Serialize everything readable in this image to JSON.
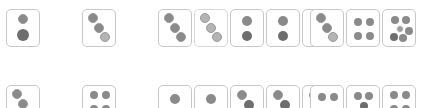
{
  "canvas": {
    "width": 422,
    "height": 108,
    "background": "#ffffff",
    "description": "Two horizontal rows of small white rounded dice-face cards with gray pips; bottom row is clipped by the image edge"
  },
  "style": {
    "card_fill": "#ffffff",
    "card_border": "#c8c8c8",
    "card_border_light": "#d8d8d8",
    "pip_dark": "#6e6e6e",
    "pip_mid": "#8a8a8a",
    "pip_light": "#b4b4b4",
    "card_width": 34,
    "card_height": 38,
    "card_radius": 5
  },
  "rows": [
    {
      "name": "top-row",
      "top": 9,
      "clipped": false,
      "groups": [
        {
          "name": "group-1",
          "left": 6,
          "cards": [
            {
              "name": "card-two-vertical",
              "pip_count": 2,
              "layout": "vertical-center",
              "border": "normal",
              "pips": [
                {
                  "x": 16,
                  "y": 9,
                  "r": 5,
                  "tone": "mid",
                  "style": "ring"
                },
                {
                  "x": 16,
                  "y": 25,
                  "r": 6,
                  "tone": "dark",
                  "style": "plain"
                }
              ]
            }
          ]
        },
        {
          "name": "group-2",
          "left": 82,
          "cards": [
            {
              "name": "card-three-diagonal",
              "pip_count": 3,
              "layout": "diagonal-down-right",
              "border": "normal",
              "pips": [
                {
                  "x": 10,
                  "y": 8,
                  "r": 5,
                  "tone": "mid",
                  "style": "ring"
                },
                {
                  "x": 16,
                  "y": 18,
                  "r": 5,
                  "tone": "mid",
                  "style": "ring"
                },
                {
                  "x": 22,
                  "y": 27,
                  "r": 5,
                  "tone": "light",
                  "style": "ring"
                }
              ]
            }
          ]
        },
        {
          "name": "group-3",
          "left": 158,
          "cards": [
            {
              "name": "card-three-diagonal",
              "pip_count": 3,
              "layout": "diagonal-down-right",
              "border": "normal",
              "pips": [
                {
                  "x": 10,
                  "y": 8,
                  "r": 5,
                  "tone": "mid",
                  "style": "ring"
                },
                {
                  "x": 16,
                  "y": 18,
                  "r": 5,
                  "tone": "mid",
                  "style": "ring"
                },
                {
                  "x": 22,
                  "y": 27,
                  "r": 5,
                  "tone": "mid",
                  "style": "ring"
                }
              ]
            },
            {
              "name": "card-three-diagonal-light",
              "pip_count": 3,
              "layout": "diagonal-down-right",
              "border": "light",
              "pips": [
                {
                  "x": 10,
                  "y": 8,
                  "r": 5,
                  "tone": "light",
                  "style": "ring"
                },
                {
                  "x": 16,
                  "y": 18,
                  "r": 5,
                  "tone": "light",
                  "style": "ring"
                },
                {
                  "x": 22,
                  "y": 27,
                  "r": 5,
                  "tone": "light",
                  "style": "ring"
                }
              ]
            },
            {
              "name": "card-two-vertical",
              "pip_count": 2,
              "layout": "vertical-center",
              "border": "normal",
              "pips": [
                {
                  "x": 16,
                  "y": 11,
                  "r": 5,
                  "tone": "mid",
                  "style": "plain"
                },
                {
                  "x": 16,
                  "y": 26,
                  "r": 5,
                  "tone": "dark",
                  "style": "plain"
                }
              ]
            },
            {
              "name": "card-two-vertical",
              "pip_count": 2,
              "layout": "vertical-center",
              "border": "normal",
              "pips": [
                {
                  "x": 16,
                  "y": 11,
                  "r": 5,
                  "tone": "mid",
                  "style": "plain"
                },
                {
                  "x": 16,
                  "y": 26,
                  "r": 5,
                  "tone": "dark",
                  "style": "plain"
                }
              ]
            },
            {
              "name": "card-two-vertical",
              "pip_count": 2,
              "layout": "vertical-center",
              "border": "normal",
              "pips": [
                {
                  "x": 16,
                  "y": 11,
                  "r": 5,
                  "tone": "mid",
                  "style": "plain"
                },
                {
                  "x": 16,
                  "y": 26,
                  "r": 5,
                  "tone": "dark",
                  "style": "plain"
                }
              ]
            }
          ]
        },
        {
          "name": "group-4",
          "left": 310,
          "cards": [
            {
              "name": "card-three-diagonal",
              "pip_count": 3,
              "layout": "diagonal-down-right",
              "border": "normal",
              "pips": [
                {
                  "x": 10,
                  "y": 8,
                  "r": 5,
                  "tone": "mid",
                  "style": "ring"
                },
                {
                  "x": 16,
                  "y": 18,
                  "r": 5,
                  "tone": "mid",
                  "style": "ring"
                },
                {
                  "x": 22,
                  "y": 27,
                  "r": 5,
                  "tone": "light",
                  "style": "ring"
                }
              ]
            },
            {
              "name": "card-four-square",
              "pip_count": 4,
              "layout": "square-2x2",
              "border": "normal",
              "pips": [
                {
                  "x": 11,
                  "y": 12,
                  "r": 4,
                  "tone": "mid",
                  "style": "plain"
                },
                {
                  "x": 23,
                  "y": 12,
                  "r": 4,
                  "tone": "mid",
                  "style": "plain"
                },
                {
                  "x": 11,
                  "y": 26,
                  "r": 4,
                  "tone": "mid",
                  "style": "plain"
                },
                {
                  "x": 23,
                  "y": 26,
                  "r": 4,
                  "tone": "mid",
                  "style": "plain"
                }
              ]
            },
            {
              "name": "card-six-grid",
              "pip_count": 6,
              "layout": "grid-2x3",
              "border": "normal",
              "pips": [
                {
                  "x": 12,
                  "y": 10,
                  "r": 4,
                  "tone": "mid",
                  "style": "plain"
                },
                {
                  "x": 23,
                  "y": 10,
                  "r": 4,
                  "tone": "mid",
                  "style": "plain"
                },
                {
                  "x": 17,
                  "y": 19,
                  "r": 4,
                  "tone": "dark",
                  "style": "halo"
                },
                {
                  "x": 11,
                  "y": 27,
                  "r": 4,
                  "tone": "dark",
                  "style": "plain"
                },
                {
                  "x": 20,
                  "y": 28,
                  "r": 4,
                  "tone": "mid",
                  "style": "plain"
                },
                {
                  "x": 26,
                  "y": 21,
                  "r": 4,
                  "tone": "mid",
                  "style": "plain"
                }
              ]
            }
          ]
        }
      ]
    },
    {
      "name": "bottom-row",
      "top": 85,
      "clipped": true,
      "groups": [
        {
          "name": "group-1",
          "left": 6,
          "cards": [
            {
              "name": "card-three-diagonal",
              "pip_count": 3,
              "layout": "diagonal-down-right",
              "border": "normal",
              "pips": [
                {
                  "x": 10,
                  "y": 8,
                  "r": 5,
                  "tone": "mid",
                  "style": "ring"
                },
                {
                  "x": 16,
                  "y": 18,
                  "r": 5,
                  "tone": "mid",
                  "style": "ring"
                },
                {
                  "x": 22,
                  "y": 27,
                  "r": 5,
                  "tone": "light",
                  "style": "ring"
                }
              ]
            }
          ]
        },
        {
          "name": "group-2",
          "left": 82,
          "cards": [
            {
              "name": "card-four-square",
              "pip_count": 4,
              "layout": "square-2x2",
              "border": "normal",
              "pips": [
                {
                  "x": 11,
                  "y": 9,
                  "r": 4,
                  "tone": "mid",
                  "style": "plain"
                },
                {
                  "x": 23,
                  "y": 9,
                  "r": 4,
                  "tone": "mid",
                  "style": "plain"
                },
                {
                  "x": 11,
                  "y": 23,
                  "r": 4,
                  "tone": "mid",
                  "style": "plain"
                },
                {
                  "x": 23,
                  "y": 23,
                  "r": 4,
                  "tone": "mid",
                  "style": "plain"
                }
              ]
            }
          ]
        },
        {
          "name": "group-3",
          "left": 158,
          "cards": [
            {
              "name": "card-one-center",
              "pip_count": 1,
              "layout": "single-center",
              "border": "normal",
              "pips": [
                {
                  "x": 16,
                  "y": 13,
                  "r": 5,
                  "tone": "mid",
                  "style": "plain"
                }
              ]
            },
            {
              "name": "card-one-center",
              "pip_count": 1,
              "layout": "single-center",
              "border": "normal",
              "pips": [
                {
                  "x": 16,
                  "y": 13,
                  "r": 5,
                  "tone": "mid",
                  "style": "plain"
                }
              ]
            },
            {
              "name": "card-two-diagonal",
              "pip_count": 2,
              "layout": "diagonal-down-right",
              "border": "normal",
              "pips": [
                {
                  "x": 11,
                  "y": 9,
                  "r": 5,
                  "tone": "mid",
                  "style": "ring"
                },
                {
                  "x": 18,
                  "y": 19,
                  "r": 5,
                  "tone": "dark",
                  "style": "plain"
                }
              ]
            },
            {
              "name": "card-two-diagonal",
              "pip_count": 2,
              "layout": "diagonal-down-right",
              "border": "normal",
              "pips": [
                {
                  "x": 11,
                  "y": 9,
                  "r": 5,
                  "tone": "mid",
                  "style": "ring"
                },
                {
                  "x": 18,
                  "y": 19,
                  "r": 5,
                  "tone": "dark",
                  "style": "plain"
                }
              ]
            },
            {
              "name": "card-two-diagonal",
              "pip_count": 2,
              "layout": "diagonal-down-right",
              "border": "normal",
              "pips": [
                {
                  "x": 11,
                  "y": 9,
                  "r": 5,
                  "tone": "mid",
                  "style": "ring"
                },
                {
                  "x": 18,
                  "y": 19,
                  "r": 5,
                  "tone": "dark",
                  "style": "plain"
                }
              ]
            }
          ]
        },
        {
          "name": "group-4",
          "left": 310,
          "cards": [
            {
              "name": "card-two-horizontal",
              "pip_count": 2,
              "layout": "horizontal-pair",
              "border": "normal",
              "pips": [
                {
                  "x": 11,
                  "y": 11,
                  "r": 4,
                  "tone": "mid",
                  "style": "plain"
                },
                {
                  "x": 23,
                  "y": 11,
                  "r": 4,
                  "tone": "mid",
                  "style": "plain"
                }
              ]
            },
            {
              "name": "card-three-triangle",
              "pip_count": 3,
              "layout": "triangle",
              "border": "normal",
              "pips": [
                {
                  "x": 11,
                  "y": 10,
                  "r": 4,
                  "tone": "mid",
                  "style": "plain"
                },
                {
                  "x": 22,
                  "y": 10,
                  "r": 4,
                  "tone": "mid",
                  "style": "plain"
                },
                {
                  "x": 17,
                  "y": 20,
                  "r": 4,
                  "tone": "dark",
                  "style": "plain"
                }
              ]
            },
            {
              "name": "card-four-square",
              "pip_count": 4,
              "layout": "square-2x2",
              "border": "normal",
              "pips": [
                {
                  "x": 11,
                  "y": 9,
                  "r": 4,
                  "tone": "mid",
                  "style": "plain"
                },
                {
                  "x": 23,
                  "y": 9,
                  "r": 4,
                  "tone": "mid",
                  "style": "plain"
                },
                {
                  "x": 11,
                  "y": 23,
                  "r": 4,
                  "tone": "mid",
                  "style": "plain"
                },
                {
                  "x": 23,
                  "y": 23,
                  "r": 4,
                  "tone": "mid",
                  "style": "plain"
                }
              ]
            }
          ]
        }
      ]
    }
  ]
}
